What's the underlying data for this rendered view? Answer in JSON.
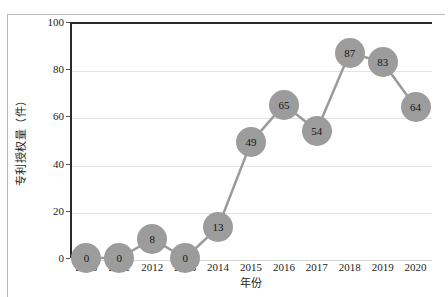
{
  "chart_data": {
    "type": "line",
    "title": "",
    "xlabel": "年份",
    "ylabel": "专利授权量（件）",
    "categories": [
      "2010",
      "2011",
      "2012",
      "2013",
      "2014",
      "2015",
      "2016",
      "2017",
      "2018",
      "2019",
      "2020"
    ],
    "values": [
      0,
      0,
      8,
      0,
      13,
      49,
      65,
      54,
      87,
      83,
      64
    ],
    "data_labels": [
      "0",
      "0",
      "8",
      "0",
      "13",
      "49",
      "65",
      "54",
      "87",
      "83",
      "64"
    ],
    "ylim": [
      0,
      100
    ],
    "yticks": [
      0,
      20,
      40,
      60,
      80,
      100
    ],
    "ytick_labels": [
      "0",
      "20",
      "40",
      "60",
      "80",
      "100"
    ],
    "grid": true,
    "legend": "none",
    "series": [
      {
        "name": "专利授权量",
        "values": [
          0,
          0,
          8,
          0,
          13,
          49,
          65,
          54,
          87,
          83,
          64
        ],
        "marker_color": "#9c9c9c",
        "line_color": "#9a9a9a"
      }
    ],
    "colors": {
      "marker": "#9c9c9c",
      "line": "#9a9a9a",
      "gridline": "#e2e2e2",
      "axis": "#2b2b2b",
      "frame": "#b9b9b9",
      "text": "#1d1d1d",
      "background": "#ffffff"
    }
  }
}
